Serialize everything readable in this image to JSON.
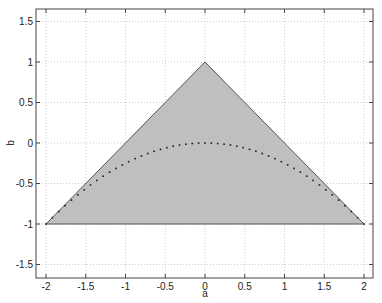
{
  "chart_data": {
    "type": "area",
    "title": "",
    "xlabel": "a",
    "ylabel": "b",
    "xlim": [
      -2.13,
      2.13
    ],
    "ylim": [
      -1.67,
      1.66
    ],
    "grid": true,
    "legend": null,
    "xticks": [
      -2,
      -1.5,
      -1,
      -0.5,
      0,
      0.5,
      1,
      1.5,
      2
    ],
    "xtick_labels": [
      "-2",
      "-1.5",
      "-1",
      "-0.5",
      "0",
      "0.5",
      "1",
      "1.5",
      "2"
    ],
    "yticks": [
      -1.5,
      -1,
      -0.5,
      0,
      0.5,
      1,
      1.5
    ],
    "ytick_labels": [
      "-1.5",
      "-1",
      "-0.5",
      "0",
      "0.5",
      "1",
      "1.5"
    ],
    "series": [
      {
        "name": "region",
        "kind": "filled-polygon",
        "fill": "#bfbfbf",
        "stroke": "#555555",
        "points": [
          [
            -2,
            -1
          ],
          [
            0,
            1
          ],
          [
            2,
            -1
          ]
        ]
      },
      {
        "name": "boundary curve b = -a^2/4",
        "kind": "dotted-line",
        "color": "#1a1a1a",
        "x": [
          -2,
          -1.5,
          -1,
          -0.5,
          0,
          0.5,
          1,
          1.5,
          2
        ],
        "y": [
          -1,
          -0.5625,
          -0.25,
          -0.0625,
          0,
          -0.0625,
          -0.25,
          -0.5625,
          -1
        ]
      }
    ]
  },
  "colors": {
    "background": "#ffffff",
    "fill": "#bfbfbf",
    "edge": "#555555",
    "axis": "#444444",
    "grid": "#cccccc",
    "dots": "#1a1a1a"
  }
}
